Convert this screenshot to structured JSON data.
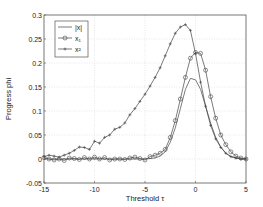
{
  "chart_data": {
    "type": "line",
    "title": "",
    "xlabel": "Threshold τ",
    "ylabel": "Progress phi",
    "xlim": [
      -15,
      5
    ],
    "ylim": [
      -0.05,
      0.3
    ],
    "xticks": [
      -15,
      -10,
      -5,
      0,
      5
    ],
    "yticks": [
      -0.05,
      0,
      0.05,
      0.1,
      0.15,
      0.2,
      0.25,
      0.3
    ],
    "xtick_labels": [
      "-15",
      "-10",
      "-5",
      "0",
      "5"
    ],
    "ytick_labels": [
      "-0.05",
      "0",
      "0.05",
      "0.1",
      "0.15",
      "0.2",
      "0.25",
      "0.3"
    ],
    "grid": true,
    "legend_position": "upper left",
    "series": [
      {
        "name": "|x|",
        "marker": "none",
        "x": [
          -15,
          -14,
          -13,
          -12,
          -11,
          -10,
          -9,
          -8,
          -7,
          -6,
          -5,
          -4,
          -3.5,
          -3,
          -2.5,
          -2,
          -1.5,
          -1,
          -0.5,
          0,
          0.5,
          1,
          1.5,
          2,
          2.5,
          3,
          3.5,
          4,
          4.5,
          5
        ],
        "y": [
          0.0,
          0.0,
          0.0,
          0.0,
          0.0,
          0.0,
          0.0,
          0.0,
          0.0,
          0.0,
          0.0,
          0.002,
          0.006,
          0.015,
          0.035,
          0.065,
          0.105,
          0.145,
          0.168,
          0.165,
          0.145,
          0.11,
          0.075,
          0.045,
          0.025,
          0.012,
          0.005,
          0.002,
          0.0,
          0.0
        ]
      },
      {
        "name": "x₁",
        "marker": "circle",
        "x": [
          -15,
          -14.5,
          -14,
          -13.5,
          -13,
          -12.5,
          -12,
          -11.5,
          -11,
          -10.5,
          -10,
          -9.5,
          -9,
          -8.5,
          -8,
          -7.5,
          -7,
          -6.5,
          -6,
          -5.5,
          -5,
          -4.5,
          -4,
          -3.5,
          -3,
          -2.5,
          -2,
          -1.5,
          -1,
          -0.5,
          0,
          0.5,
          1,
          1.5,
          2,
          2.5,
          3,
          3.5,
          4,
          4.5,
          5
        ],
        "y": [
          0.003,
          0.0,
          -0.002,
          0.0,
          -0.003,
          0.002,
          0.001,
          -0.001,
          0.003,
          0.0,
          0.004,
          0.0,
          0.003,
          -0.002,
          0.0,
          0.0,
          -0.001,
          0.002,
          0.004,
          0.001,
          -0.002,
          0.005,
          0.008,
          0.012,
          0.02,
          0.045,
          0.08,
          0.125,
          0.17,
          0.21,
          0.222,
          0.22,
          0.185,
          0.13,
          0.085,
          0.05,
          0.03,
          0.015,
          0.006,
          0.002,
          0.0
        ]
      },
      {
        "name": "x²",
        "marker": "plus",
        "x": [
          -15,
          -14.5,
          -14,
          -13.5,
          -13,
          -12.5,
          -12,
          -11.5,
          -11,
          -10.5,
          -10,
          -9.5,
          -9,
          -8.5,
          -8,
          -7.5,
          -7,
          -6.5,
          -6,
          -5.5,
          -5,
          -4.5,
          -4,
          -3.5,
          -3,
          -2.5,
          -2,
          -1.5,
          -1,
          -0.5,
          0,
          0.5,
          1,
          1.5,
          2,
          2.5,
          3,
          3.5,
          4,
          4.5,
          5
        ],
        "y": [
          0.005,
          0.008,
          0.006,
          0.004,
          0.008,
          0.012,
          0.018,
          0.025,
          0.024,
          0.02,
          0.037,
          0.033,
          0.045,
          0.05,
          0.062,
          0.066,
          0.075,
          0.092,
          0.105,
          0.12,
          0.135,
          0.152,
          0.17,
          0.19,
          0.215,
          0.24,
          0.262,
          0.275,
          0.28,
          0.268,
          0.22,
          0.16,
          0.11,
          0.07,
          0.042,
          0.024,
          0.012,
          0.005,
          0.002,
          0.0,
          0.0
        ]
      }
    ]
  }
}
